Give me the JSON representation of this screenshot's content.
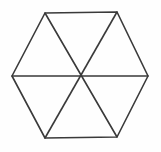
{
  "figure": {
    "title": "Regular hexagon divided into six triangles",
    "shape_name": "hexagon",
    "background_color": "#fefefe",
    "stroke_color": "#3a3a3a",
    "stroke_width": 1.6,
    "canvas": {
      "width": 161,
      "height": 152
    },
    "center": {
      "x": 80,
      "y": 76
    },
    "vertices": [
      {
        "name": "top-left",
        "x": 45,
        "y": 13
      },
      {
        "name": "top-right",
        "x": 117,
        "y": 12
      },
      {
        "name": "right",
        "x": 148,
        "y": 76
      },
      {
        "name": "bottom-right",
        "x": 117,
        "y": 137
      },
      {
        "name": "bottom-left",
        "x": 45,
        "y": 138
      },
      {
        "name": "left",
        "x": 12,
        "y": 76
      }
    ],
    "outline_path": "M 45 13 L 117 12 L 148 76 L 117 137 L 45 138 L 12 76 Z",
    "diagonals": [
      {
        "name": "diagonal-left-right",
        "x1": 12,
        "y1": 76,
        "x2": 148,
        "y2": 76
      },
      {
        "name": "diagonal-topleft-bottomright",
        "x1": 45,
        "y1": 13,
        "x2": 117,
        "y2": 137
      },
      {
        "name": "diagonal-topright-bottomleft",
        "x1": 117,
        "y1": 12,
        "x2": 45,
        "y2": 138
      }
    ],
    "triangle_count": 6
  }
}
